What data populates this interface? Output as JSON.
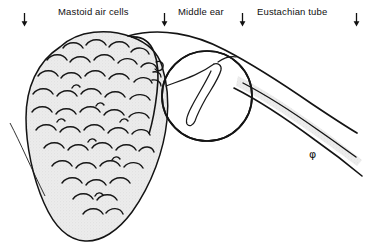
{
  "figure": {
    "type": "anatomical-line-drawing",
    "background_color": "#ffffff",
    "ink_color": "#111111",
    "shading_color": "#e7e7e7"
  },
  "labels": [
    {
      "id": "mastoid",
      "text": "Mastoid air cells",
      "x": 58,
      "y": 6
    },
    {
      "id": "middle-ear",
      "text": "Middle ear",
      "x": 178,
      "y": 6
    },
    {
      "id": "eustachian",
      "text": "Eustachian tube",
      "x": 257,
      "y": 6
    }
  ],
  "arrows": [
    {
      "id": "arrow-1",
      "x": 20,
      "points_to": "mastoid-region-left"
    },
    {
      "id": "arrow-2",
      "x": 160,
      "points_to": "mastoid-air-cells"
    },
    {
      "id": "arrow-3",
      "x": 238,
      "points_to": "middle-ear"
    },
    {
      "id": "arrow-4",
      "x": 352,
      "points_to": "eustachian-tube"
    }
  ],
  "annotations": [
    {
      "id": "phi-marker",
      "symbol": "φ",
      "x": 309,
      "y": 148
    }
  ],
  "structures": [
    {
      "id": "mastoid-body",
      "name": "mastoid process outline",
      "shaded": true
    },
    {
      "id": "air-cells",
      "name": "mastoid air cells cluster",
      "count": 34
    },
    {
      "id": "tympanic-cavity",
      "name": "middle ear cavity circle",
      "cx": 207,
      "cy": 96,
      "r": 45
    },
    {
      "id": "ossicles",
      "name": "ossicular chain",
      "shape": "hook"
    },
    {
      "id": "eustachian-tube",
      "name": "eustachian tube channel",
      "shaded": true
    }
  ]
}
